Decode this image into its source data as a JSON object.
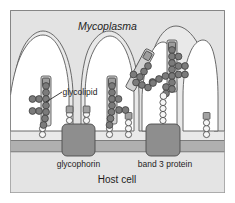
{
  "figure": {
    "title_label": "Mycoplasma",
    "labels": {
      "mycoplasma": "Mycoplasma",
      "glycolipid": "glycolipid",
      "glycophorin": "glycophorin",
      "band3": "band 3 protein",
      "host_cell": "Host cell"
    },
    "colors": {
      "page_background": "#ffffff",
      "panel_background": "#e9e9e9",
      "panel_border": "#9a9a9a",
      "mycoplasma_body": "#e3e3e3",
      "mycoplasma_outline": "#5a5a5a",
      "lobe_fill": "#ffffff",
      "membrane_band": "#b0b0b0",
      "membrane_line": "#6f6f6f",
      "host_cytoplasm": "#e4e4e4",
      "protein_fill": "#8e8e8e",
      "protein_outline": "#4c4c4c",
      "receptor_fill": "#a2a2a2",
      "receptor_outline": "#4a4a4a",
      "dark_sugar": "#7b7b7b",
      "light_sugar": "#f6f6f6",
      "sugar_outline": "#3d3d3d",
      "text": "#1d1d1d",
      "leader_line": "#2b2b2b"
    },
    "structures": {
      "mycoplasma_cells": 3,
      "lobes": 4,
      "membrane_proteins": [
        {
          "name": "glycophorin",
          "x": 78,
          "width": 32
        },
        {
          "name": "band 3 protein",
          "x": 163,
          "width": 32
        }
      ],
      "host_glycans": 7,
      "adhesin_receptors": 5
    }
  }
}
